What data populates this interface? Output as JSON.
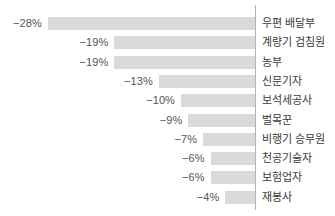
{
  "chart_data": {
    "type": "bar",
    "orientation": "horizontal",
    "title": "",
    "subtitle": "",
    "xlabel": "",
    "ylabel": "",
    "grid": false,
    "legend": null,
    "axis_zero_at": "right",
    "direction": "negative-leftward",
    "xlim": [
      -30,
      0
    ],
    "categories": [
      "우편 배달부",
      "계량기 검침원",
      "농부",
      "신문기자",
      "보석세공사",
      "벌목꾼",
      "비행기 승무원",
      "천공기술자",
      "보험업자",
      "재봉사"
    ],
    "values": [
      -28,
      -19,
      -19,
      -13,
      -10,
      -9,
      -7,
      -6,
      -6,
      -4
    ],
    "value_labels": [
      "−28%",
      "−19%",
      "−19%",
      "−13%",
      "−10%",
      "−9%",
      "−7%",
      "−6%",
      "−6%",
      "−4%"
    ],
    "colors": {
      "bar": "#d9d9d9",
      "axis": "#b3b3b3",
      "value_text": "#555555",
      "category_text": "#3a3a3a",
      "background": "#ffffff"
    }
  },
  "rows": [
    {
      "label": "우편 배달부",
      "value": -28,
      "value_label": "−28%"
    },
    {
      "label": "계량기 검침원",
      "value": -19,
      "value_label": "−19%"
    },
    {
      "label": "농부",
      "value": -19,
      "value_label": "−19%"
    },
    {
      "label": "신문기자",
      "value": -13,
      "value_label": "−13%"
    },
    {
      "label": "보석세공사",
      "value": -10,
      "value_label": "−10%"
    },
    {
      "label": "벌목꾼",
      "value": -9,
      "value_label": "−9%"
    },
    {
      "label": "비행기 승무원",
      "value": -7,
      "value_label": "−7%"
    },
    {
      "label": "천공기술자",
      "value": -6,
      "value_label": "−6%"
    },
    {
      "label": "보험업자",
      "value": -6,
      "value_label": "−6%"
    },
    {
      "label": "재봉사",
      "value": -4,
      "value_label": "−4%"
    }
  ]
}
